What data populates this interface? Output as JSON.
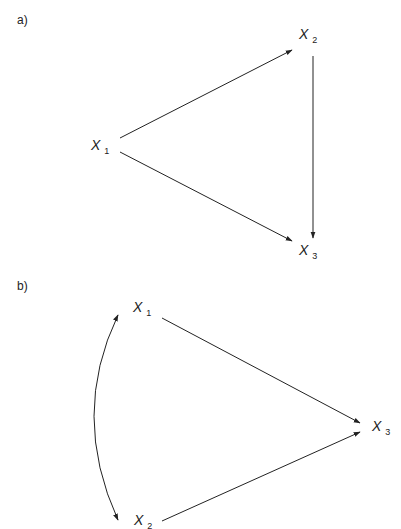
{
  "panel_a": {
    "label": "a)",
    "nodes": [
      {
        "id": "x1",
        "var": "X",
        "sub": "1"
      },
      {
        "id": "x2",
        "var": "X",
        "sub": "2"
      },
      {
        "id": "x3",
        "var": "X",
        "sub": "3"
      }
    ],
    "edges": [
      {
        "from": "x1",
        "to": "x2",
        "type": "directed"
      },
      {
        "from": "x1",
        "to": "x3",
        "type": "directed"
      },
      {
        "from": "x2",
        "to": "x3",
        "type": "directed"
      }
    ]
  },
  "panel_b": {
    "label": "b)",
    "nodes": [
      {
        "id": "x1",
        "var": "X",
        "sub": "1"
      },
      {
        "id": "x2",
        "var": "X",
        "sub": "2"
      },
      {
        "id": "x3",
        "var": "X",
        "sub": "3"
      }
    ],
    "edges": [
      {
        "from": "x1",
        "to": "x3",
        "type": "directed"
      },
      {
        "from": "x2",
        "to": "x3",
        "type": "directed"
      },
      {
        "from": "x1",
        "to": "x2",
        "type": "bidirected-curved"
      }
    ]
  }
}
